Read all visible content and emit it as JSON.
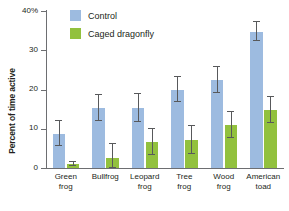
{
  "chart_data": {
    "type": "bar",
    "title": "",
    "xlabel": "",
    "ylabel": "Percent of time active",
    "ylim": [
      0,
      40
    ],
    "grid": false,
    "legend_position": "top-center",
    "ytick_labels": [
      "40%",
      "30",
      "20",
      "10",
      "0"
    ],
    "ytick_values": [
      40,
      30,
      20,
      10,
      0
    ],
    "categories": [
      "Green frog",
      "Bullfrog",
      "Leopard frog",
      "Tree frog",
      "Wood frog",
      "American toad"
    ],
    "category_lines": [
      [
        "Green",
        "frog"
      ],
      [
        "Bullfrog"
      ],
      [
        "Leopard",
        "frog"
      ],
      [
        "Tree",
        "frog"
      ],
      [
        "Wood",
        "frog"
      ],
      [
        "American",
        "toad"
      ]
    ],
    "series": [
      {
        "name": "Control",
        "color": "#9dbbe0",
        "values": [
          8.7,
          15.3,
          15.3,
          20.0,
          22.5,
          34.7
        ],
        "errors": [
          3.2,
          3.3,
          3.6,
          3.3,
          3.3,
          2.4
        ]
      },
      {
        "name": "Caged dragonfly",
        "color": "#92c13e",
        "values": [
          1.0,
          2.5,
          6.6,
          7.2,
          11.0,
          14.8
        ],
        "errors": [
          0.5,
          3.6,
          3.3,
          3.6,
          3.3,
          3.3
        ]
      }
    ]
  },
  "legend": {
    "items": [
      {
        "label": "Control",
        "color": "#9dbbe0"
      },
      {
        "label": "Caged dragonfly",
        "color": "#92c13e"
      }
    ]
  }
}
